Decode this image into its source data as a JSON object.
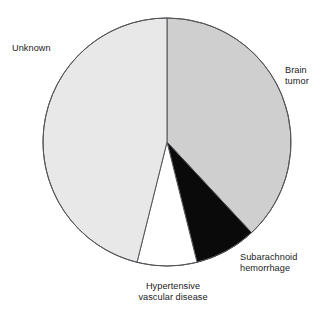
{
  "chart_data": {
    "type": "pie",
    "title": "",
    "subtitle": "",
    "xlabel": "",
    "ylabel": "",
    "legend_position": "none",
    "labels_position": "outside",
    "grid": false,
    "start_angle_deg": 0,
    "direction": "clockwise",
    "categories": [
      "Brain tumor",
      "Subarachnoid hemorrhage",
      "Hypertensive vascular disease",
      "Unknown"
    ],
    "values": [
      38,
      8,
      8,
      46
    ],
    "units": "percent",
    "slices": [
      {
        "label": "Brain tumor",
        "label_text": "Brain\ntumor",
        "value": 38,
        "start_angle_deg": 0,
        "end_angle_deg": 137,
        "color": "#cfcfcf",
        "stroke": "#55555a"
      },
      {
        "label": "Subarachnoid hemorrhage",
        "label_text": "Subarachnoid\nhemorrhage",
        "value": 8,
        "start_angle_deg": 137,
        "end_angle_deg": 166,
        "color": "#0a0a0a",
        "stroke": "#0a0a0a"
      },
      {
        "label": "Hypertensive vascular disease",
        "label_text": "Hypertensive\nvascular disease",
        "value": 8,
        "start_angle_deg": 166,
        "end_angle_deg": 194,
        "color": "#ffffff",
        "stroke": "#55555a"
      },
      {
        "label": "Unknown",
        "label_text": "Unknown",
        "value": 46,
        "start_angle_deg": 194,
        "end_angle_deg": 360,
        "color": "#e8e8e8",
        "stroke": "#55555a"
      }
    ]
  },
  "geometry": {
    "center_x": 167,
    "center_y": 142,
    "radius": 124
  },
  "labels": {
    "unknown": "Unknown",
    "brain_tumor": "Brain\ntumor",
    "subarachnoid": "Subarachnoid\nhemorrhage",
    "hypertensive": "Hypertensive\nvascular disease"
  },
  "colors": {
    "background": "#ffffff",
    "slice_unknown": "#e8e8e8",
    "slice_brain_tumor": "#cfcfcf",
    "slice_subarachnoid": "#0a0a0a",
    "slice_hypertensive": "#ffffff",
    "outline": "#55555a",
    "text": "#1b1b1b"
  }
}
